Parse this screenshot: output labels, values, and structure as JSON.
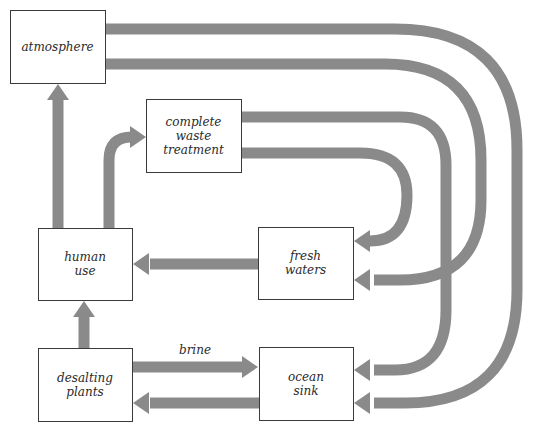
{
  "colors": {
    "arrow": "#8a8a8a",
    "box_border": "#3a3a3a",
    "background": "#ffffff"
  },
  "nodes": [
    {
      "id": "atmosphere",
      "lines": [
        "atmosphere"
      ]
    },
    {
      "id": "waste",
      "lines": [
        "complete",
        "waste",
        "treatment"
      ]
    },
    {
      "id": "human",
      "lines": [
        "human",
        "use"
      ]
    },
    {
      "id": "fresh",
      "lines": [
        "fresh",
        "waters"
      ]
    },
    {
      "id": "desalting",
      "lines": [
        "desalting",
        "plants"
      ]
    },
    {
      "id": "ocean",
      "lines": [
        "ocean",
        "sink"
      ]
    }
  ],
  "edges": [
    {
      "id": "human-to-atmosphere",
      "from": "human",
      "to": "atmosphere",
      "label": ""
    },
    {
      "id": "human-to-waste",
      "from": "human",
      "to": "waste",
      "label": ""
    },
    {
      "id": "atmosphere-to-ocean",
      "from": "atmosphere",
      "to": "ocean",
      "label": ""
    },
    {
      "id": "atmosphere-to-fresh",
      "from": "atmosphere",
      "to": "fresh",
      "label": ""
    },
    {
      "id": "waste-to-ocean",
      "from": "waste",
      "to": "ocean",
      "label": ""
    },
    {
      "id": "waste-to-fresh",
      "from": "waste",
      "to": "fresh",
      "label": ""
    },
    {
      "id": "fresh-to-human",
      "from": "fresh",
      "to": "human",
      "label": ""
    },
    {
      "id": "desalting-to-human",
      "from": "desalting",
      "to": "human",
      "label": ""
    },
    {
      "id": "desalting-to-ocean",
      "from": "desalting",
      "to": "ocean",
      "label": "brine"
    },
    {
      "id": "ocean-to-desalting",
      "from": "ocean",
      "to": "desalting",
      "label": ""
    }
  ]
}
